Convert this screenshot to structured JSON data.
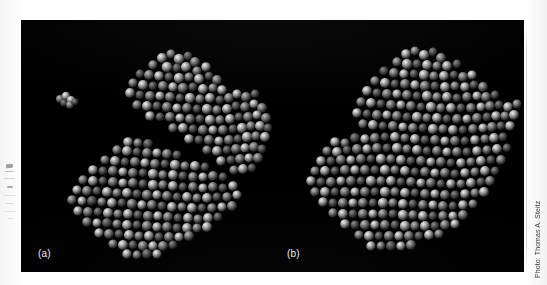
{
  "figure": {
    "plate_background": "#000000",
    "page_background": "#ffffff",
    "panels": [
      {
        "id": "a",
        "label": "(a)",
        "description": "Space-filling model of the enzyme in the open conformation with the substrate molecule separated at the upper left.",
        "has_detached_substrate": true
      },
      {
        "id": "b",
        "label": "(b)",
        "description": "Space-filling model of the enzyme in the closed conformation with the substrate engulfed in the cleft.",
        "has_detached_substrate": false
      }
    ]
  },
  "credit": {
    "text": "Photo: Thomas A. Steitz",
    "orientation": "vertical",
    "color": "#3a3a3a"
  },
  "colors": {
    "plate": "#000000",
    "label_text": "#ededed",
    "sphere_highlight": "#e8e8e8",
    "sphere_midtone": "#7a7a7a",
    "sphere_shadow": "#1a1a1a"
  }
}
